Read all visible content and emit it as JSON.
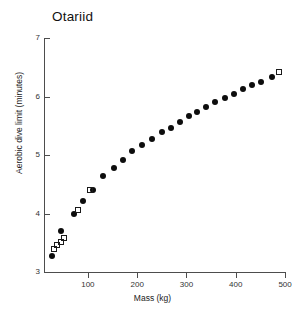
{
  "chart_data": {
    "type": "scatter",
    "title": "Otariid",
    "xlabel": "Mass (kg)",
    "ylabel": "Aerobic dive limit (minutes)",
    "xlim": [
      11,
      510
    ],
    "ylim": [
      3,
      7
    ],
    "xticks": [
      100,
      200,
      300,
      400,
      500
    ],
    "yticks": [
      3,
      4,
      5,
      6,
      7
    ],
    "xtick_labels": [
      "100",
      "200",
      "300",
      "400",
      "500"
    ],
    "ytick_labels": [
      "3",
      "4",
      "5",
      "6",
      "7"
    ],
    "grid": false,
    "legend": "none",
    "series": [
      {
        "name": "filled-circles",
        "marker": "filled-circle",
        "color": "#0d0d0d",
        "points": [
          {
            "x": 28,
            "y": 3.27
          },
          {
            "x": 45,
            "y": 3.7
          },
          {
            "x": 72,
            "y": 3.99
          },
          {
            "x": 90,
            "y": 4.21
          },
          {
            "x": 110,
            "y": 4.4
          },
          {
            "x": 131,
            "y": 4.64
          },
          {
            "x": 152,
            "y": 4.78
          },
          {
            "x": 172,
            "y": 4.91
          },
          {
            "x": 190,
            "y": 5.06
          },
          {
            "x": 210,
            "y": 5.17
          },
          {
            "x": 230,
            "y": 5.28
          },
          {
            "x": 250,
            "y": 5.39
          },
          {
            "x": 268,
            "y": 5.47
          },
          {
            "x": 286,
            "y": 5.57
          },
          {
            "x": 305,
            "y": 5.66
          },
          {
            "x": 322,
            "y": 5.74
          },
          {
            "x": 340,
            "y": 5.82
          },
          {
            "x": 358,
            "y": 5.9
          },
          {
            "x": 378,
            "y": 5.98
          },
          {
            "x": 396,
            "y": 6.05
          },
          {
            "x": 414,
            "y": 6.13
          },
          {
            "x": 432,
            "y": 6.19
          },
          {
            "x": 452,
            "y": 6.25
          },
          {
            "x": 474,
            "y": 6.33
          }
        ]
      },
      {
        "name": "open-squares",
        "marker": "open-square",
        "color": "#1a1a1a",
        "points": [
          {
            "x": 31,
            "y": 3.4
          },
          {
            "x": 38,
            "y": 3.46
          },
          {
            "x": 45,
            "y": 3.52
          },
          {
            "x": 52,
            "y": 3.58
          },
          {
            "x": 80,
            "y": 4.06
          },
          {
            "x": 104,
            "y": 4.41
          },
          {
            "x": 488,
            "y": 6.42
          }
        ]
      }
    ]
  }
}
